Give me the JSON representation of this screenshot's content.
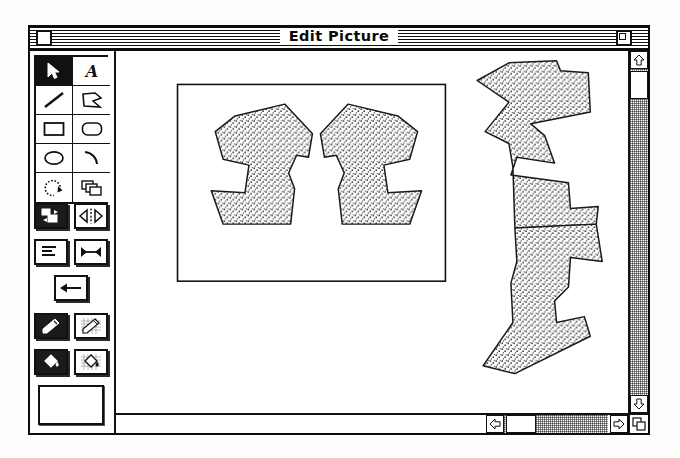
{
  "window": {
    "title": "Edit Picture",
    "close_box": "close-box",
    "zoom_box": "zoom-box"
  },
  "palette": {
    "shape_tools": [
      {
        "name": "arrow-select-tool",
        "icon": "arrow-cursor-icon",
        "selected": true
      },
      {
        "name": "text-tool",
        "icon": "script-a-icon",
        "selected": false
      },
      {
        "name": "line-tool",
        "icon": "diagonal-line-icon",
        "selected": false
      },
      {
        "name": "polygon-tool",
        "icon": "polygon-icon",
        "selected": false
      },
      {
        "name": "rectangle-tool",
        "icon": "rectangle-icon",
        "selected": false
      },
      {
        "name": "rounded-rectangle-tool",
        "icon": "rounded-rectangle-icon",
        "selected": false
      },
      {
        "name": "oval-tool",
        "icon": "oval-icon",
        "selected": false
      },
      {
        "name": "arc-tool",
        "icon": "arc-icon",
        "selected": false
      },
      {
        "name": "rotate-tool",
        "icon": "rotate-arrow-icon",
        "selected": false
      },
      {
        "name": "layers-tool",
        "icon": "overlapping-shapes-icon",
        "selected": false
      }
    ],
    "action_buttons": [
      {
        "name": "align-objects-button",
        "icon": "align-objects-icon"
      },
      {
        "name": "flip-horizontal-button",
        "icon": "flip-horizontal-icon"
      },
      {
        "name": "text-align-button",
        "icon": "text-lines-icon"
      },
      {
        "name": "distribute-button",
        "icon": "horizontal-span-icon"
      },
      {
        "name": "send-left-button",
        "icon": "arrow-left-icon"
      },
      {
        "name": "pen-color-button",
        "icon": "pencil-icon",
        "dark": true
      },
      {
        "name": "pen-pattern-button",
        "icon": "pencil-grid-icon",
        "dark": false
      },
      {
        "name": "fill-color-button",
        "icon": "paint-bucket-icon",
        "dark": true
      },
      {
        "name": "fill-pattern-button",
        "icon": "paint-bucket-grid-icon",
        "dark": false
      }
    ],
    "swatch_preview": "current-pattern-swatch"
  },
  "canvas": {
    "picture_frame": "picture-frame",
    "shapes": [
      {
        "name": "left-mirror-polygon",
        "fill": "stipple",
        "points": "42,20 92,8 120,38 116,62 104,60 96,78 102,94 98,130 30,130 18,96 52,98 56,70 30,64 22,36"
      },
      {
        "name": "right-mirror-polygon",
        "fill": "stipple",
        "points": "128,38 156,8 206,20 226,36 218,64 192,70 196,98 230,96 218,130 150,130 146,94 152,78 144,60 132,62"
      },
      {
        "name": "tall-zigzag-polygon-upper",
        "fill": "stipple",
        "points": "12,22 44,4 92,2 96,12 124,14 126,54 66,66 80,78 90,106 52,100 46,118 104,126 106,152 134,150 132,168 50,172 48,110 44,86 20,74 44,44"
      },
      {
        "name": "tall-zigzag-polygon-lower",
        "fill": "stipple",
        "points": "50,172 132,168 138,206 106,202 104,232 90,246 92,268 120,262 126,282 50,320 18,312 48,268 46,228 52,206"
      }
    ]
  },
  "scrollbars": {
    "vertical": {
      "name": "vertical-scrollbar",
      "up_arrow": "scroll-up-arrow",
      "down_arrow": "scroll-down-arrow",
      "thumb": "vertical-scroll-thumb"
    },
    "horizontal": {
      "name": "horizontal-scrollbar",
      "left_arrow": "scroll-left-arrow",
      "right_arrow": "scroll-right-arrow",
      "thumb": "horizontal-scroll-thumb"
    },
    "grow_box": "resize-grow-box"
  }
}
